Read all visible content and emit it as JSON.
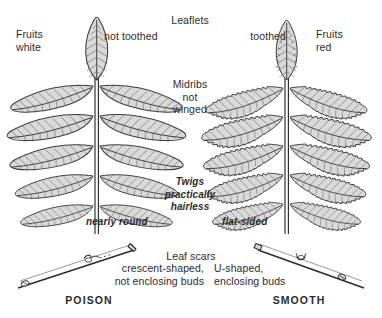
{
  "figure": {
    "background_color": "#ffffff",
    "ink_color": "#2b2b2b",
    "leaf_fill_color": "#d9d9d9",
    "leaf_outline_color": "#3a3a3a"
  },
  "shared_labels": {
    "leaflets": "Leaflets",
    "midribs": "Midribs\nnot\nwinged",
    "twigs": "Twigs\npractically\nhairless",
    "leaf_scars": "Leaf scars"
  },
  "left": {
    "name": "POISON",
    "fruits": "Fruits\nwhite",
    "leaflet_margin": "not toothed",
    "twig_shape": "nearly round",
    "leaf_scar": "crescent-shaped,\nnot enclosing buds"
  },
  "right": {
    "name": "SMOOTH",
    "fruits": "Fruits\nred",
    "leaflet_margin": "toothed",
    "twig_shape": "flat-sided",
    "leaf_scar": "U-shaped,\nenclosing buds"
  }
}
